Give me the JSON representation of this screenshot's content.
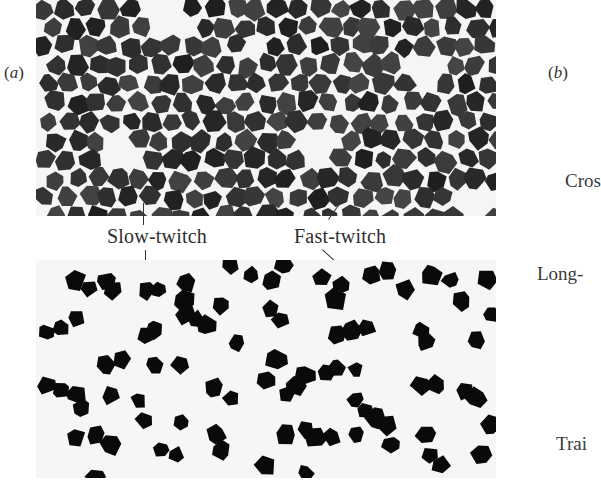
{
  "figure": {
    "panel_a": {
      "label_open": "(",
      "label_letter": "a",
      "label_close": ")",
      "top_image": "ATPase-stained muscle cross-section micrograph (dark fibers with white borders)",
      "bottom_image": "Serial section micrograph with selectively dark-stained fibers on light background",
      "annotations": {
        "slow_twitch": "Slow-twitch",
        "fast_twitch": "Fast-twitch"
      }
    },
    "panel_b": {
      "label_open": "(",
      "label_letter": "b",
      "label_close": ")",
      "labels_truncated": [
        "Cros",
        "Long-",
        "Trai"
      ]
    },
    "colors": {
      "background": "#ffffff",
      "fiber_dark": "#2b2b2b",
      "fiber_black": "#0a0a0a",
      "membrane_white": "#f5f5f5",
      "text": "#2e2e2e"
    }
  }
}
